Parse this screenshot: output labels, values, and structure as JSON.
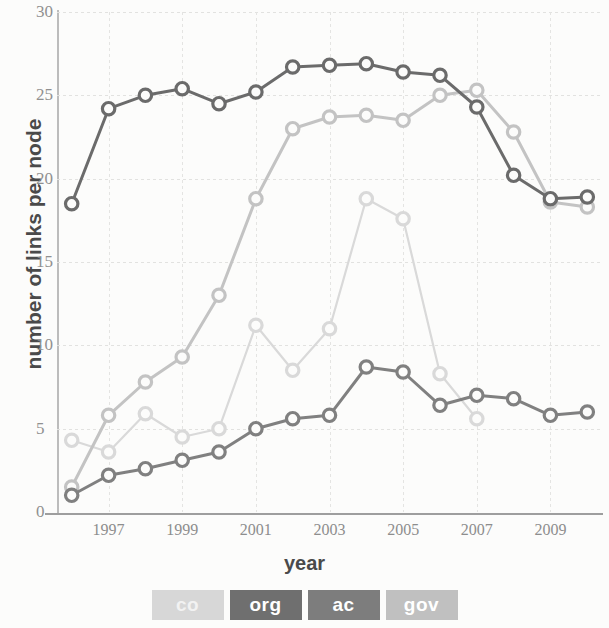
{
  "chart_data": {
    "type": "line",
    "title": "",
    "xlabel": "year",
    "ylabel": "number of links per node",
    "xlim": [
      1995.6,
      2010.4
    ],
    "ylim": [
      0,
      30
    ],
    "xticks": [
      1997,
      1999,
      2001,
      2003,
      2005,
      2007,
      2009
    ],
    "yticks": [
      0,
      5,
      10,
      15,
      20,
      25,
      30
    ],
    "grid": true,
    "legend_position": "bottom",
    "x": [
      1996,
      1997,
      1998,
      1999,
      2000,
      2001,
      2002,
      2003,
      2004,
      2005,
      2006,
      2007,
      2008,
      2009,
      2010
    ],
    "series": [
      {
        "name": "co",
        "color": "#d9d9d9",
        "values": [
          4.3,
          3.6,
          5.9,
          4.5,
          5.0,
          11.2,
          8.5,
          11.0,
          18.8,
          17.6,
          8.3,
          5.6,
          null,
          null,
          null
        ]
      },
      {
        "name": "org",
        "color": "#6b6b6b",
        "values": [
          18.5,
          24.2,
          25.0,
          25.4,
          24.5,
          25.2,
          26.7,
          26.8,
          26.9,
          26.4,
          26.2,
          24.3,
          20.2,
          18.8,
          18.9
        ]
      },
      {
        "name": "ac",
        "color": "#808080",
        "values": [
          1.0,
          2.2,
          2.6,
          3.1,
          3.6,
          5.0,
          5.6,
          5.8,
          8.7,
          8.4,
          6.4,
          7.0,
          6.8,
          5.8,
          6.0
        ]
      },
      {
        "name": "gov",
        "color": "#c3c3c3",
        "values": [
          1.5,
          5.8,
          7.8,
          9.3,
          13.0,
          18.8,
          23.0,
          23.7,
          23.8,
          23.5,
          25.0,
          25.3,
          22.8,
          18.6,
          18.3
        ]
      }
    ]
  },
  "axes": {
    "ylabel": "number of links per node",
    "xlabel": "year",
    "yticks": [
      "0",
      "5",
      "10",
      "15",
      "20",
      "25",
      "30"
    ],
    "xticks": [
      "1997",
      "1999",
      "2001",
      "2003",
      "2005",
      "2007",
      "2009"
    ]
  },
  "legend": {
    "items": [
      {
        "label": "co",
        "swatch": "#d7d7d7",
        "text_color": "#f2f2f2"
      },
      {
        "label": "org",
        "swatch": "#6f6f6f",
        "text_color": "#ffffff"
      },
      {
        "label": "ac",
        "swatch": "#7d7d7d",
        "text_color": "#ffffff"
      },
      {
        "label": "gov",
        "swatch": "#c0c0c0",
        "text_color": "#ffffff"
      }
    ]
  }
}
